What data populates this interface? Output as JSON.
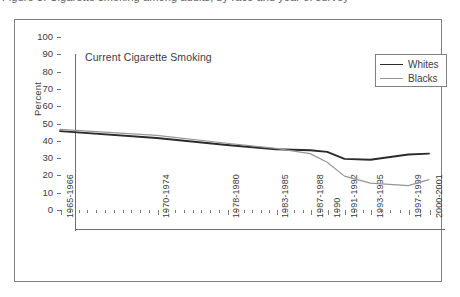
{
  "caption": {
    "text": "Figure 3. Cigarette smoking among adults, by race and year of survey"
  },
  "chart_data": {
    "type": "line",
    "title": "Current Cigarette Smoking",
    "xlabel": "",
    "ylabel": "Percent",
    "ylim": [
      0,
      100
    ],
    "ytick_step": 10,
    "yticks": [
      0,
      10,
      20,
      30,
      40,
      50,
      60,
      70,
      80,
      90,
      100
    ],
    "ytick_labels": [
      "0",
      "10",
      "20",
      "30",
      "40",
      "50",
      "60",
      "70",
      "80",
      "90",
      "100"
    ],
    "categories": [
      "1965-1966",
      "1970-1974",
      "1978-1980",
      "1983-1985",
      "1987-1988",
      "1990",
      "1991-1992",
      "1993-1995",
      "1997-1999",
      "2000-2001"
    ],
    "category_positions": [
      0.0,
      0.262,
      0.452,
      0.585,
      0.678,
      0.724,
      0.771,
      0.841,
      0.944,
      1.0
    ],
    "series": [
      {
        "name": "Whites",
        "color": "#2b2b2b",
        "width": 1.9,
        "values": [
          45.0,
          41.0,
          37.0,
          34.5,
          34.0,
          33.0,
          29.0,
          28.5,
          31.5,
          32.0
        ]
      },
      {
        "name": "Blacks",
        "color": "#969696",
        "width": 1.2,
        "values": [
          46.0,
          42.5,
          38.0,
          35.0,
          32.0,
          27.0,
          19.0,
          15.0,
          13.5,
          17.0
        ]
      }
    ],
    "grid": false,
    "legend_position": "top-right",
    "legend_entries": [
      "Whites",
      "Blacks"
    ]
  }
}
